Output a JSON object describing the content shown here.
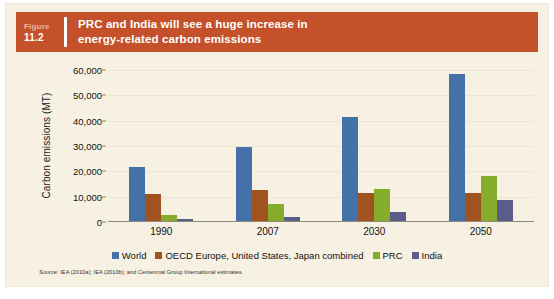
{
  "figure": {
    "label": "Figure",
    "number": "11.2",
    "title_line1": "PRC and India will see a huge increase in",
    "title_line2": "energy-related carbon emissions",
    "band_color": "#c4512a",
    "panel_color": "#f6f1e3"
  },
  "source": {
    "prefix": "Source:",
    "text": " IEA (2010a); IEA (2010b); and Centennial Group International estimates."
  },
  "chart_data": {
    "type": "bar",
    "title": "PRC and India will see a huge increase in energy-related carbon emissions",
    "xlabel": "",
    "ylabel": "Carbon emissions (MT)",
    "categories": [
      "1990",
      "2007",
      "2030",
      "2050"
    ],
    "series": [
      {
        "name": "World",
        "color": "#4472a8",
        "values": [
          21000,
          29000,
          41000,
          58000
        ]
      },
      {
        "name": "OECD Europe, United States, Japan combined",
        "color": "#a0531f",
        "values": [
          10500,
          12000,
          11000,
          11000
        ]
      },
      {
        "name": "PRC",
        "color": "#85ac2b",
        "values": [
          2300,
          6500,
          12500,
          17500
        ]
      },
      {
        "name": "India",
        "color": "#5c5c8a",
        "values": [
          600,
          1500,
          3500,
          8000
        ]
      }
    ],
    "ylim": [
      0,
      60000
    ],
    "yticks": [
      0,
      10000,
      20000,
      30000,
      40000,
      50000,
      60000
    ],
    "ytick_labels": [
      "0",
      "10,000",
      "20,000",
      "30,000",
      "40,000",
      "50,000",
      "60,000"
    ],
    "grid": true,
    "legend_position": "bottom"
  }
}
